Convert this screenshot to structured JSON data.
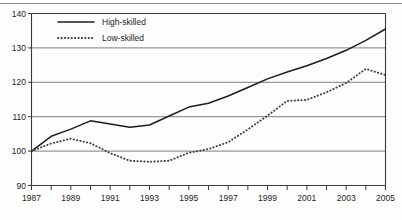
{
  "chart_data": {
    "type": "line",
    "title": "",
    "subtitle": "",
    "xlabel": "",
    "ylabel": "",
    "xlim": [
      1987,
      2005
    ],
    "ylim": [
      90,
      140
    ],
    "yticks": [
      90,
      100,
      110,
      120,
      130,
      140
    ],
    "ytick_labels": [
      "90",
      "100",
      "110",
      "120",
      "130",
      "140"
    ],
    "x": [
      1987,
      1988,
      1989,
      1990,
      1991,
      1992,
      1993,
      1994,
      1995,
      1996,
      1997,
      1998,
      1999,
      2000,
      2001,
      2002,
      2003,
      2004,
      2005
    ],
    "xtick_labels": [
      "1987",
      "",
      "1989",
      "",
      "1991",
      "",
      "1993",
      "",
      "1995",
      "",
      "1997",
      "",
      "1999",
      "",
      "2001",
      "",
      "2003",
      "",
      "2005"
    ],
    "xticks_all": [
      1987,
      1988,
      1989,
      1990,
      1991,
      1992,
      1993,
      1994,
      1995,
      1996,
      1997,
      1998,
      1999,
      2000,
      2001,
      2002,
      2003,
      2004,
      2005
    ],
    "xticks_labeled": [
      1987,
      1989,
      1991,
      1993,
      1995,
      1997,
      1999,
      2001,
      2003,
      2005
    ],
    "grid": true,
    "grid_axis": "y",
    "legend_position": "top-left",
    "series": [
      {
        "name": "High-skilled",
        "style": "solid",
        "color": "#1d1d1d",
        "values": [
          100.0,
          104.3,
          106.4,
          108.8,
          107.9,
          106.9,
          107.6,
          110.2,
          112.8,
          113.9,
          116.0,
          118.5,
          121.0,
          123.0,
          124.8,
          126.9,
          129.3,
          132.2,
          135.5
        ]
      },
      {
        "name": "Low-skilled",
        "style": "dotted",
        "color": "#3a3a3a",
        "values": [
          100.0,
          102.2,
          103.6,
          102.3,
          99.4,
          97.2,
          96.9,
          97.2,
          99.5,
          100.6,
          102.6,
          106.3,
          110.3,
          114.6,
          114.9,
          117.1,
          119.8,
          123.9,
          122.1
        ]
      }
    ]
  },
  "legend": {
    "items": [
      {
        "label": "High-skilled",
        "style": "solid"
      },
      {
        "label": "Low-skilled",
        "style": "dotted"
      }
    ]
  }
}
